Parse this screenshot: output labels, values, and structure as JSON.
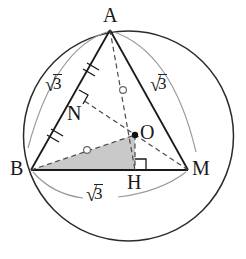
{
  "figure": {
    "type": "geometry-diagram",
    "background": "#ffffff",
    "stroke_dark": "#1a1a1a",
    "stroke_light": "#8c8c8c",
    "shade_fill": "#c9c9c9"
  },
  "points": [
    {
      "id": "A",
      "label": "A",
      "x": 110,
      "y": 30,
      "label_x": 103,
      "label_y": 5,
      "dot": false
    },
    {
      "id": "B",
      "label": "B",
      "x": 31,
      "y": 170,
      "label_x": 10,
      "label_y": 158,
      "dot": false
    },
    {
      "id": "M",
      "label": "M",
      "x": 188,
      "y": 170,
      "label_x": 192,
      "label_y": 158,
      "dot": false
    },
    {
      "id": "O",
      "label": "O",
      "x": 135,
      "y": 135,
      "label_x": 140,
      "label_y": 122,
      "dot": true
    },
    {
      "id": "H",
      "label": "H",
      "x": 135,
      "y": 170,
      "label_x": 127,
      "label_y": 172,
      "dot": false
    },
    {
      "id": "N",
      "label": "N",
      "x": 83,
      "y": 100,
      "label_x": 67,
      "label_y": 103,
      "dot": false
    }
  ],
  "circle": {
    "cx": 128.5,
    "cy": 136,
    "r": 105
  },
  "segments": [
    {
      "name": "side-AB",
      "from": "A",
      "to": "B",
      "style": "solid"
    },
    {
      "name": "side-AM",
      "from": "A",
      "to": "M",
      "style": "solid"
    },
    {
      "name": "side-BM",
      "from": "B",
      "to": "M",
      "style": "solid"
    },
    {
      "name": "median-AH",
      "from": "A",
      "to": "H",
      "style": "dashed"
    },
    {
      "name": "median-MN",
      "from": "M",
      "to": "N",
      "style": "dashed"
    },
    {
      "name": "segment-BO",
      "from": "B",
      "to": "O",
      "style": "dashed"
    },
    {
      "name": "segment-OM",
      "from": "O",
      "to": "M",
      "style": "dashed"
    },
    {
      "name": "altitude-OH",
      "from": "O",
      "to": "H",
      "style": "dashed"
    }
  ],
  "shaded_region": {
    "name": "triangle-BOH",
    "vertices": [
      "B",
      "O",
      "H"
    ],
    "fill": "#c9c9c9"
  },
  "right_angles": [
    {
      "name": "right-angle-at-N",
      "at": "N"
    },
    {
      "name": "right-angle-at-H",
      "at": "H"
    }
  ],
  "tick_marks": [
    {
      "name": "tick-AN",
      "on": "side-AB",
      "count": 2
    },
    {
      "name": "tick-NB",
      "on": "side-AB",
      "count": 2
    }
  ],
  "angle_circles": [
    {
      "name": "angle-marker-AO",
      "x": 123,
      "y": 90
    },
    {
      "name": "angle-marker-BO",
      "x": 87,
      "y": 150
    }
  ],
  "labels": {
    "sqrt_symbol": "√",
    "sqrt_value": "3",
    "measures": [
      {
        "name": "measure-AB",
        "text": "√3",
        "x": 45,
        "y": 74
      },
      {
        "name": "measure-AM",
        "text": "√3",
        "x": 150,
        "y": 74
      },
      {
        "name": "measure-BM",
        "text": "√3",
        "x": 86,
        "y": 184
      }
    ]
  },
  "arcs": [
    {
      "name": "arc-label-AB",
      "from": "A",
      "to": "B"
    },
    {
      "name": "arc-label-AM",
      "from": "A",
      "to": "M"
    },
    {
      "name": "arc-label-BM-left",
      "from": "B",
      "to": "label"
    },
    {
      "name": "arc-label-BM-right",
      "from": "label",
      "to": "M"
    }
  ]
}
